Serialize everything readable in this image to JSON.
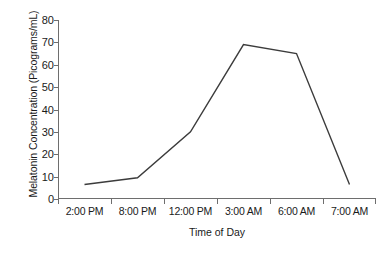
{
  "chart_data": {
    "type": "line",
    "title": "",
    "xlabel": "Time of Day",
    "ylabel": "Melatonin Concentration (Picograms/mL)",
    "categories": [
      "2:00 PM",
      "8:00 PM",
      "12:00 PM",
      "3:00 AM",
      "6:00 AM",
      "7:00 AM"
    ],
    "values": [
      6.5,
      9.5,
      30,
      69,
      65,
      6.5
    ],
    "series": [
      {
        "name": "Melatonin Concentration",
        "values": [
          6.5,
          9.5,
          30,
          69,
          65,
          6.5
        ]
      }
    ],
    "ylim": [
      0,
      80
    ],
    "ytick_labels": [
      "0",
      "10",
      "20",
      "30",
      "40",
      "50",
      "60",
      "70",
      "80"
    ],
    "ytick_values": [
      0,
      10,
      20,
      30,
      40,
      50,
      60,
      70,
      80
    ],
    "grid": false,
    "legend": false,
    "markers": false,
    "line_color": "#3c3c3c",
    "axis_color": "#6e6e6e",
    "text_color": "#1a1a1a",
    "background_color": "#ffffff"
  }
}
